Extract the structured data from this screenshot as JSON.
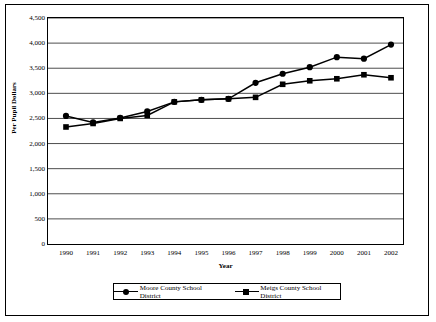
{
  "chart_data": {
    "type": "line",
    "title": "",
    "xlabel": "Year",
    "ylabel": "Per Pupil Dollars",
    "categories": [
      "1990",
      "1991",
      "1992",
      "1993",
      "1994",
      "1995",
      "1996",
      "1997",
      "1998",
      "1999",
      "2000",
      "2001",
      "2002"
    ],
    "ylim": [
      0,
      4500
    ],
    "yticks": [
      "0",
      "500",
      "1,000",
      "1,500",
      "2,000",
      "2,500",
      "3,000",
      "3,500",
      "4,000",
      "4,500"
    ],
    "ytick_values": [
      0,
      500,
      1000,
      1500,
      2000,
      2500,
      3000,
      3500,
      4000,
      4500
    ],
    "grid": "horizontal",
    "legend_position": "bottom",
    "series": [
      {
        "name": "Moore County School District",
        "marker": "circle",
        "color": "#000000",
        "values": [
          2550,
          2420,
          2510,
          2640,
          2830,
          2870,
          2890,
          3210,
          3390,
          3520,
          3720,
          3690,
          3970
        ]
      },
      {
        "name": "Meigs County School District",
        "marker": "square",
        "color": "#000000",
        "values": [
          2330,
          2400,
          2500,
          2560,
          2830,
          2870,
          2890,
          2920,
          3180,
          3250,
          3290,
          3370,
          3310
        ]
      }
    ]
  }
}
